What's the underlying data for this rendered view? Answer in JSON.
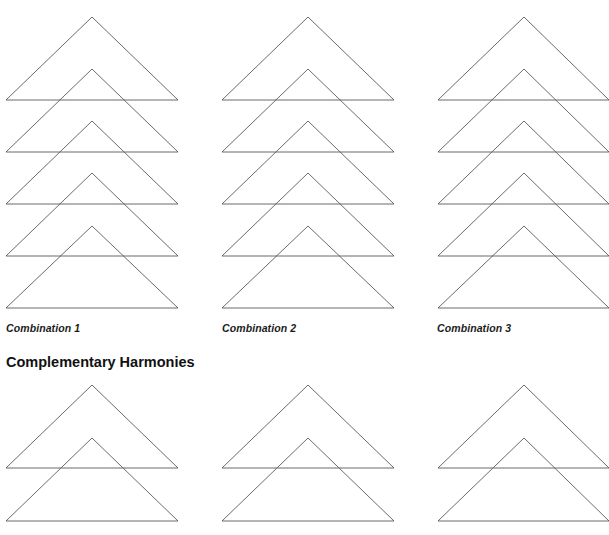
{
  "sections": [
    {
      "id": "combinations",
      "heading": "",
      "columns": [
        {
          "caption": "Combination 1",
          "apex_x": 92,
          "left_x": 6,
          "right_x": 178
        },
        {
          "caption": "Combination 2",
          "apex_x": 308,
          "left_x": 222,
          "right_x": 394
        },
        {
          "caption": "Combination 3",
          "apex_x": 524,
          "left_x": 438,
          "right_x": 609
        }
      ],
      "triangles_per_column": 5,
      "apex_y": [
        17,
        69,
        121,
        173,
        226
      ],
      "base_y": [
        100,
        152,
        204,
        256,
        308
      ]
    },
    {
      "id": "complementary",
      "heading": "Complementary Harmonies",
      "columns": [
        {
          "apex_x": 92,
          "left_x": 6,
          "right_x": 178
        },
        {
          "apex_x": 308,
          "left_x": 222,
          "right_x": 394
        },
        {
          "apex_x": 524,
          "left_x": 438,
          "right_x": 609
        }
      ],
      "triangles_per_column": 2,
      "apex_y": [
        385,
        438
      ],
      "base_y": [
        468,
        521
      ]
    }
  ],
  "style": {
    "line_color": "#5a5a5a"
  }
}
